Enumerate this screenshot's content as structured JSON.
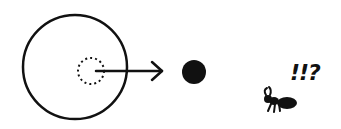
{
  "diagram": {
    "title": "",
    "elements": [
      {
        "id": "outer-circle",
        "shape": "circle",
        "style": "solid outline"
      },
      {
        "id": "inner-circle",
        "shape": "circle",
        "style": "dotted outline"
      },
      {
        "id": "arrow",
        "shape": "arrow",
        "from": "inner-circle",
        "to": "black-dot"
      },
      {
        "id": "black-dot",
        "shape": "filled circle"
      },
      {
        "id": "ant",
        "shape": "ant drawing"
      }
    ],
    "annotation": "!!?",
    "colors": {
      "ink": "#111111",
      "background": "#ffffff"
    }
  }
}
